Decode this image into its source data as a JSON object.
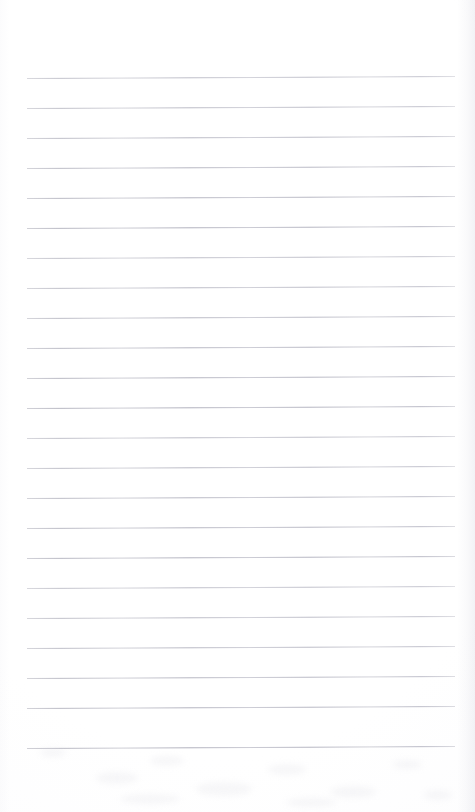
{
  "document": {
    "kind": "scanned-lined-notepaper",
    "page_label": "",
    "visible_text": "",
    "background_color": "#fefeff",
    "page_width": 475,
    "page_height": 812
  },
  "ruling": {
    "line_color": "#b4b4be",
    "line_thickness_px": 1,
    "line_count": 23,
    "line_spacing_px": 30,
    "first_line_y": 78,
    "last_line_y": 748,
    "line_left_x": 27,
    "line_right_x": 455,
    "skew_deg": -0.27,
    "lines_y": [
      78,
      108,
      138,
      168,
      198,
      228,
      258,
      288,
      318,
      348,
      378,
      408,
      438,
      468,
      498,
      528,
      558,
      588,
      618,
      648,
      678,
      708,
      748
    ]
  },
  "margins": {
    "top_margin_height": 78,
    "bottom_margin_height": 64,
    "left_margin_width": 27,
    "right_margin_width": 20
  },
  "scan_artifacts": {
    "edge_shadow_color": "#dcdce4",
    "smudge_color": "#e2e2e8",
    "smudges": [
      {
        "x": 40,
        "y": 6,
        "w": 26,
        "h": 9
      },
      {
        "x": 96,
        "y": 30,
        "w": 42,
        "h": 12
      },
      {
        "x": 150,
        "y": 14,
        "w": 34,
        "h": 10
      },
      {
        "x": 196,
        "y": 40,
        "w": 56,
        "h": 14
      },
      {
        "x": 268,
        "y": 22,
        "w": 38,
        "h": 11
      },
      {
        "x": 330,
        "y": 44,
        "w": 46,
        "h": 12
      },
      {
        "x": 392,
        "y": 18,
        "w": 30,
        "h": 9
      },
      {
        "x": 120,
        "y": 52,
        "w": 60,
        "h": 10
      },
      {
        "x": 286,
        "y": 56,
        "w": 50,
        "h": 9
      },
      {
        "x": 424,
        "y": 48,
        "w": 28,
        "h": 10
      }
    ]
  }
}
